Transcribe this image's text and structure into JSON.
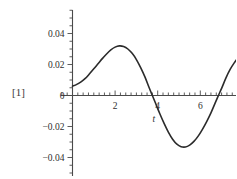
{
  "output_label": "[1]",
  "chart_data": {
    "type": "line",
    "title": "",
    "subtitle": "",
    "xlabel": "t",
    "ylabel": "",
    "grid": false,
    "legend": null,
    "xlim": [
      -0.55,
      8.6
    ],
    "ylim": [
      -0.055,
      0.055
    ],
    "x_ticks_major": [
      2,
      4,
      6,
      8
    ],
    "x_tick_labels": [
      "2",
      "4",
      "6",
      "8"
    ],
    "x_ticks_minor_step": 0.25,
    "y_ticks_major": [
      0.04,
      0.02,
      0,
      -0.02,
      -0.04
    ],
    "y_tick_labels": [
      "0.04",
      "0.02",
      "0",
      "−0.02",
      "−0.04"
    ],
    "y_ticks_minor_step": 0.005,
    "axis_color": "#4a4a4a",
    "line_color": "#2b2b2b",
    "line_width": 1.6,
    "background": "#ffffff",
    "series": [
      {
        "name": "curve",
        "x": [
          0.0,
          0.2,
          0.4,
          0.6,
          0.8,
          1.0,
          1.2,
          1.4,
          1.6,
          1.8,
          2.0,
          2.2,
          2.4,
          2.6,
          2.8,
          3.0,
          3.2,
          3.4,
          3.6,
          3.75,
          3.9,
          4.1,
          4.3,
          4.5,
          4.7,
          4.9,
          5.1,
          5.3,
          5.5,
          5.7,
          5.9,
          6.1,
          6.3,
          6.5,
          6.7,
          6.85,
          7.0,
          7.2,
          7.4,
          7.6,
          7.8,
          8.0
        ],
        "y": [
          0.006,
          0.0072,
          0.0088,
          0.011,
          0.014,
          0.0172,
          0.0205,
          0.0238,
          0.0268,
          0.0294,
          0.0312,
          0.032,
          0.0316,
          0.03,
          0.0272,
          0.0232,
          0.018,
          0.012,
          0.005,
          0.0,
          -0.005,
          -0.0118,
          -0.018,
          -0.0236,
          -0.0282,
          -0.0314,
          -0.033,
          -0.0332,
          -0.032,
          -0.0296,
          -0.0262,
          -0.0218,
          -0.0168,
          -0.0112,
          -0.0048,
          0.0,
          0.0046,
          0.0112,
          0.0168,
          0.0212,
          0.0248,
          0.0272
        ]
      }
    ]
  }
}
